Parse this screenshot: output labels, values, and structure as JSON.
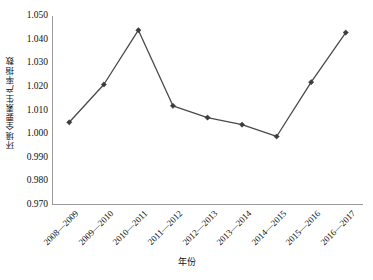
{
  "chart_data": {
    "type": "line",
    "title": "",
    "subtitle": "",
    "xlabel": "年份",
    "ylabel": "环境全要素生产率指数",
    "categories": [
      "2008—2009",
      "2009—2010",
      "2010—2011",
      "2011—2012",
      "2012—2013",
      "2013—2014",
      "2014—2015",
      "2015—2016",
      "2016—2017"
    ],
    "values": [
      1.005,
      1.021,
      1.044,
      1.012,
      1.007,
      1.004,
      0.999,
      1.022,
      1.043
    ],
    "series": [
      {
        "name": "环境全要素生产率指数",
        "values": [
          1.005,
          1.021,
          1.044,
          1.012,
          1.007,
          1.004,
          0.999,
          1.022,
          1.043
        ]
      }
    ],
    "ylim": [
      0.97,
      1.05
    ],
    "ytick_step": 0.01,
    "yticks": [
      1.05,
      1.04,
      1.03,
      1.02,
      1.01,
      1.0,
      0.99,
      0.98,
      0.97
    ],
    "ytick_labels": [
      "1.050",
      "1.040",
      "1.030",
      "1.020",
      "1.010",
      "1.000",
      "0.990",
      "0.980",
      "0.970"
    ],
    "grid": false,
    "legend": false,
    "legend_position": "none",
    "marker": "diamond",
    "xtick_rotation": -45,
    "colors": {
      "line": "#4a4a4a",
      "marker": "#3c3c3c",
      "axis": "#9a9a9a",
      "background": "#ffffff",
      "text": "#111111"
    }
  }
}
